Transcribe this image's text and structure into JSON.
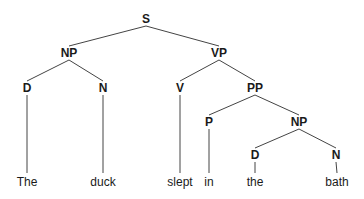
{
  "diagram": {
    "type": "syntax-tree",
    "nodes": [
      {
        "id": "S",
        "label": "S",
        "x": 146,
        "y": 19
      },
      {
        "id": "NP1",
        "label": "NP",
        "x": 69,
        "y": 53
      },
      {
        "id": "VP",
        "label": "VP",
        "x": 219,
        "y": 53
      },
      {
        "id": "D1",
        "label": "D",
        "x": 27,
        "y": 88
      },
      {
        "id": "N1",
        "label": "N",
        "x": 103,
        "y": 88
      },
      {
        "id": "V",
        "label": "V",
        "x": 180,
        "y": 88
      },
      {
        "id": "PP",
        "label": "PP",
        "x": 255,
        "y": 88
      },
      {
        "id": "P",
        "label": "P",
        "x": 209,
        "y": 122
      },
      {
        "id": "NP2",
        "label": "NP",
        "x": 299,
        "y": 122
      },
      {
        "id": "D2",
        "label": "D",
        "x": 255,
        "y": 155
      },
      {
        "id": "N2",
        "label": "N",
        "x": 336,
        "y": 155
      }
    ],
    "leaves": [
      {
        "id": "w1",
        "label": "The",
        "x": 27,
        "y": 186,
        "parent": "D1"
      },
      {
        "id": "w2",
        "label": "duck",
        "x": 103,
        "y": 186,
        "parent": "N1"
      },
      {
        "id": "w3",
        "label": "slept",
        "x": 180,
        "y": 186,
        "parent": "V"
      },
      {
        "id": "w4",
        "label": "in",
        "x": 209,
        "y": 186,
        "parent": "P"
      },
      {
        "id": "w5",
        "label": "the",
        "x": 255,
        "y": 186,
        "parent": "D2"
      },
      {
        "id": "w6",
        "label": "bath",
        "x": 337,
        "y": 186,
        "parent": "N2"
      }
    ],
    "edges": [
      [
        "S",
        "NP1"
      ],
      [
        "S",
        "VP"
      ],
      [
        "NP1",
        "D1"
      ],
      [
        "NP1",
        "N1"
      ],
      [
        "VP",
        "V"
      ],
      [
        "VP",
        "PP"
      ],
      [
        "PP",
        "P"
      ],
      [
        "PP",
        "NP2"
      ],
      [
        "NP2",
        "D2"
      ],
      [
        "NP2",
        "N2"
      ]
    ],
    "colors": {
      "text": "#1a1a1a",
      "edge": "#444444",
      "background": "#ffffff"
    }
  }
}
